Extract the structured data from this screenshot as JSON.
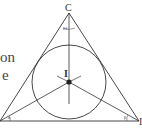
{
  "text_fragments": [
    "on",
    "e"
  ],
  "labels": {
    "vertex_top": "C",
    "incenter": "I",
    "vertex_right_partial": "I"
  },
  "angle_marks": {
    "top": "θ θ",
    "left": "α",
    "right": "β"
  },
  "colors": {
    "line": "#333333",
    "background": "#ffffff"
  }
}
